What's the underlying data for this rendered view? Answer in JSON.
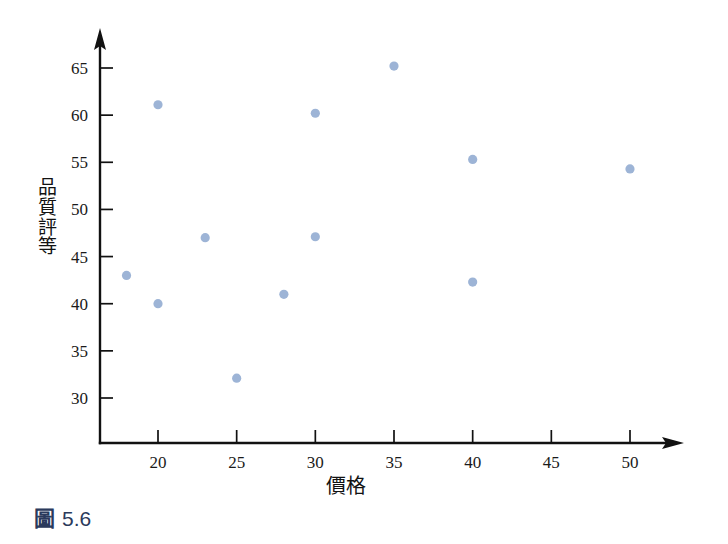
{
  "figure": {
    "caption_mark": "圖",
    "caption_number": "5.6",
    "caption_color": "#2b3a5c"
  },
  "chart_data": {
    "type": "scatter",
    "title": "",
    "xlabel": "價格",
    "ylabel": "品質評等",
    "ylabel_chars": [
      "品",
      "質",
      "評",
      "等"
    ],
    "xlim": [
      16.5,
      53.5
    ],
    "ylim": [
      28.3,
      66.8
    ],
    "xticks": [
      20,
      25,
      30,
      35,
      40,
      45,
      50
    ],
    "xtick_labels": [
      "20",
      "25",
      "30",
      "35",
      "40",
      "45",
      "50"
    ],
    "yticks": [
      30,
      35,
      40,
      45,
      50,
      55,
      60,
      65
    ],
    "ytick_labels": [
      "30",
      "35",
      "40",
      "45",
      "50",
      "55",
      "60",
      "65"
    ],
    "grid": false,
    "legend": null,
    "marker_color": "#9db4d6",
    "marker_radius": 4.6,
    "axis_color": "#111111",
    "points": [
      {
        "x": 18,
        "y": 43.0
      },
      {
        "x": 20,
        "y": 61.1
      },
      {
        "x": 20,
        "y": 40.0
      },
      {
        "x": 23,
        "y": 47.0
      },
      {
        "x": 25,
        "y": 32.1
      },
      {
        "x": 28,
        "y": 41.0
      },
      {
        "x": 30,
        "y": 60.2
      },
      {
        "x": 30,
        "y": 47.1
      },
      {
        "x": 35,
        "y": 65.2
      },
      {
        "x": 40,
        "y": 55.3
      },
      {
        "x": 40,
        "y": 42.3
      },
      {
        "x": 50,
        "y": 54.3
      }
    ]
  }
}
